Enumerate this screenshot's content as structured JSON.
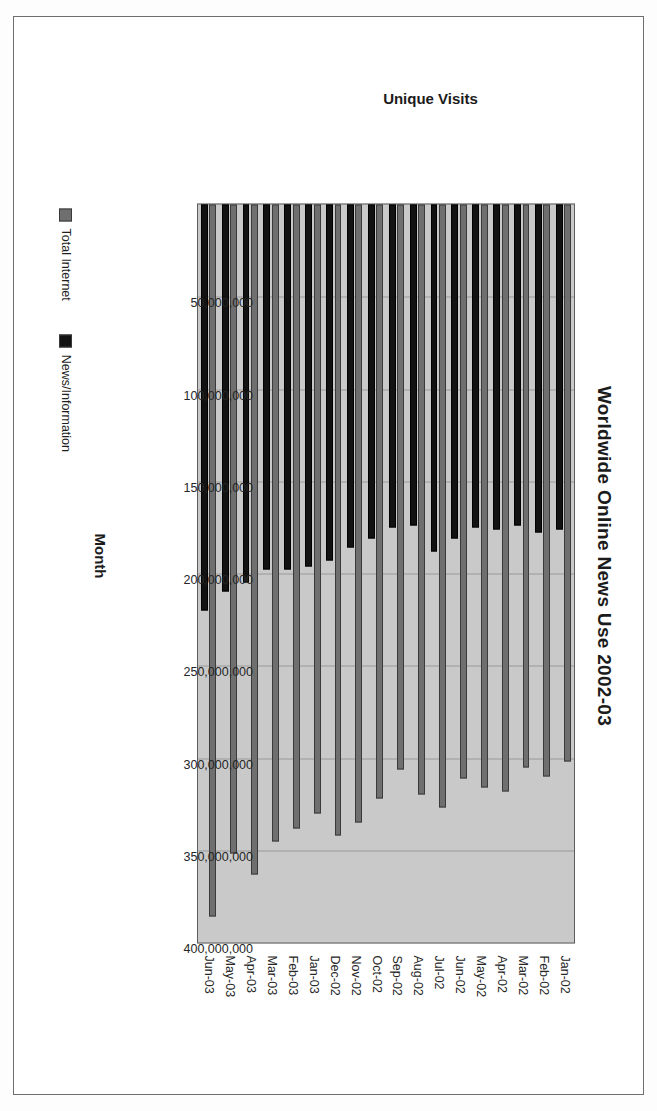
{
  "chart_data": {
    "type": "bar",
    "orientation": "vertical",
    "title": "Worldwide Online News Use 2002-03",
    "xlabel": "Month",
    "ylabel": "Unique Visits",
    "ylim": [
      0,
      400000000
    ],
    "ytick_labels": [
      "400,000,000",
      "350,000,000",
      "300,000,000",
      "250,000,000",
      "200,000,000",
      "150,000,000",
      "100,000,000",
      "50,000,000"
    ],
    "ytick_values": [
      400000000,
      350000000,
      300000000,
      250000000,
      200000000,
      150000000,
      100000000,
      50000000
    ],
    "grid": true,
    "legend_position": "bottom-left",
    "categories": [
      "Jan-02",
      "Feb-02",
      "Mar-02",
      "Apr-02",
      "May-02",
      "Jun-02",
      "Jul-02",
      "Aug-02",
      "Sep-02",
      "Oct-02",
      "Nov-02",
      "Dec-02",
      "Jan-03",
      "Feb-03",
      "Mar-03",
      "Apr-03",
      "May-03",
      "Jun-03"
    ],
    "series": [
      {
        "name": "Total Internet",
        "color": "#6f6f6f",
        "values": [
          302000000,
          310000000,
          305000000,
          318000000,
          316000000,
          311000000,
          327000000,
          320000000,
          306000000,
          322000000,
          335000000,
          342000000,
          330000000,
          338000000,
          345000000,
          363000000,
          352000000,
          386000000
        ]
      },
      {
        "name": "News/Information",
        "color": "#121212",
        "values": [
          176000000,
          178000000,
          174000000,
          176000000,
          175000000,
          181000000,
          188000000,
          174000000,
          175000000,
          181000000,
          186000000,
          193000000,
          196000000,
          198000000,
          198000000,
          205000000,
          210000000,
          220000000
        ]
      }
    ]
  },
  "chart": {
    "title": "Worldwide Online News Use 2002-03",
    "xlabel": "Month",
    "ylabel": "Unique Visits",
    "legend": [
      {
        "label": "Total Internet"
      },
      {
        "label": "News/Information"
      }
    ]
  }
}
